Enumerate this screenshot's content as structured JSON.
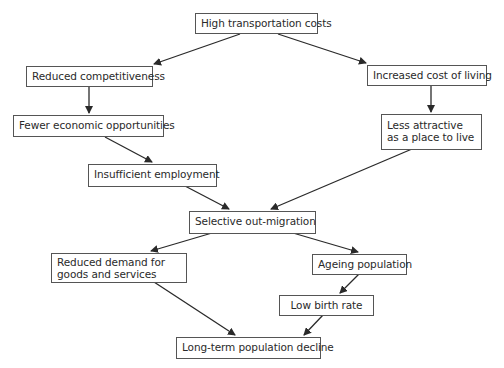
{
  "diagram": {
    "type": "flowchart",
    "nodes": [
      {
        "id": "n1",
        "label": "High transportation costs"
      },
      {
        "id": "n2",
        "label": "Reduced competitiveness"
      },
      {
        "id": "n3",
        "label": "Increased cost of living"
      },
      {
        "id": "n4",
        "label": "Fewer economic opportunities"
      },
      {
        "id": "n5",
        "label": "Less attractive as a place to live"
      },
      {
        "id": "n6",
        "label": "Insufficient employment"
      },
      {
        "id": "n7",
        "label": "Selective out-migration"
      },
      {
        "id": "n8",
        "label": "Reduced demand for goods and services"
      },
      {
        "id": "n9",
        "label": "Ageing population"
      },
      {
        "id": "n10",
        "label": "Low birth rate"
      },
      {
        "id": "n11",
        "label": "Long-term population decline"
      }
    ],
    "edges": [
      {
        "from": "n1",
        "to": "n2"
      },
      {
        "from": "n1",
        "to": "n3"
      },
      {
        "from": "n2",
        "to": "n4"
      },
      {
        "from": "n3",
        "to": "n5"
      },
      {
        "from": "n4",
        "to": "n6"
      },
      {
        "from": "n6",
        "to": "n7"
      },
      {
        "from": "n5",
        "to": "n7"
      },
      {
        "from": "n7",
        "to": "n8"
      },
      {
        "from": "n7",
        "to": "n9"
      },
      {
        "from": "n9",
        "to": "n10"
      },
      {
        "from": "n8",
        "to": "n11"
      },
      {
        "from": "n10",
        "to": "n11"
      }
    ],
    "colors": {
      "line": "#2a2a2a",
      "border": "#555555",
      "background": "#ffffff"
    }
  }
}
